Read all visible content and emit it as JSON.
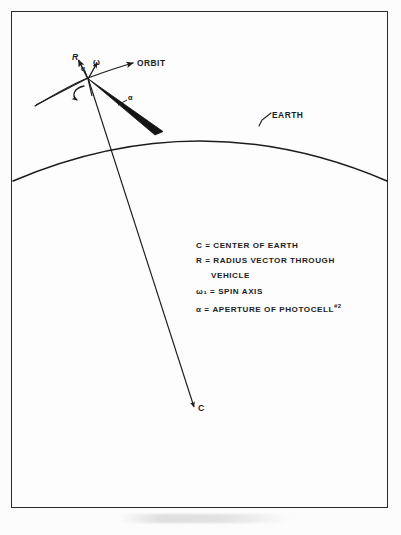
{
  "figure": {
    "background_color": "#fcfcfc",
    "frame_color": "#2b2b2b",
    "ink_color": "#1c1c1c"
  },
  "diagram": {
    "title_labels": {
      "orbit": "ORBIT",
      "earth": "EARTH",
      "center": "C",
      "radius_vector": "R",
      "spin_axis": "ω",
      "aperture_vertex": "α",
      "aperture_wedge": "α"
    },
    "elements": [
      "orbit-arc",
      "earth-arc",
      "radius-line",
      "aperture-wedge",
      "spin-axis-arrow",
      "radius-arrow",
      "rotation-curl"
    ]
  },
  "legend": {
    "lines": [
      {
        "text": "C = CENTER OF EARTH",
        "indent": false
      },
      {
        "text": "R = RADIUS  VECTOR  THROUGH",
        "indent": false
      },
      {
        "text": "VEHICLE",
        "indent": true
      },
      {
        "text": "ω₁ = SPIN  AXIS",
        "indent": false
      },
      {
        "text": "α = APERTURE OF PHOTOCELL",
        "indent": false,
        "suffix": "#2"
      }
    ]
  }
}
